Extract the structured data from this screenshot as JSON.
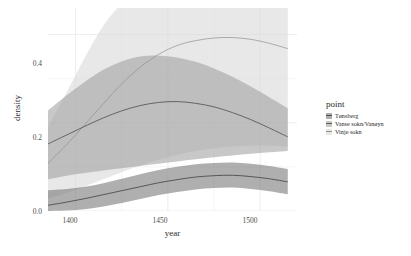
{
  "chart_data": {
    "type": "area",
    "title": "",
    "xlabel": "year",
    "ylabel": "density",
    "xlim": [
      1385,
      1520
    ],
    "ylim": [
      0.0,
      0.46
    ],
    "x_ticks": [
      1400,
      1450,
      1500
    ],
    "x_tick_labels": [
      "1400",
      "1450",
      "1500"
    ],
    "y_ticks": [
      0.0,
      0.2,
      0.4
    ],
    "y_tick_labels": [
      "0.0",
      "0.2",
      "0.4"
    ],
    "grid": true,
    "legend_position": "right",
    "legend_title": "point",
    "x": [
      1385,
      1395,
      1405,
      1415,
      1425,
      1435,
      1445,
      1455,
      1465,
      1475,
      1485,
      1495,
      1505,
      1515
    ],
    "series": [
      {
        "name": "Tønsberg",
        "color": "#4d4d4d",
        "band_color": "#6e6e6e",
        "band_opacity": 0.55,
        "values": [
          0.013,
          0.02,
          0.028,
          0.037,
          0.046,
          0.055,
          0.064,
          0.071,
          0.077,
          0.08,
          0.081,
          0.078,
          0.073,
          0.066
        ],
        "band_lower": [
          0.0,
          0.001,
          0.004,
          0.01,
          0.018,
          0.027,
          0.036,
          0.043,
          0.049,
          0.052,
          0.053,
          0.05,
          0.045,
          0.038
        ],
        "band_upper": [
          0.047,
          0.05,
          0.055,
          0.063,
          0.073,
          0.083,
          0.093,
          0.1,
          0.106,
          0.109,
          0.11,
          0.107,
          0.102,
          0.095
        ]
      },
      {
        "name": "Vanse sokn/Vanøyn",
        "color": "#5a5a5a",
        "band_color": "#9a9a9a",
        "band_opacity": 0.55,
        "values": [
          0.152,
          0.172,
          0.192,
          0.211,
          0.227,
          0.239,
          0.246,
          0.248,
          0.244,
          0.236,
          0.223,
          0.207,
          0.188,
          0.168
        ],
        "band_lower": [
          0.072,
          0.08,
          0.086,
          0.092,
          0.097,
          0.102,
          0.107,
          0.112,
          0.117,
          0.122,
          0.126,
          0.13,
          0.133,
          0.136
        ],
        "band_upper": [
          0.228,
          0.262,
          0.293,
          0.32,
          0.339,
          0.35,
          0.352,
          0.348,
          0.338,
          0.323,
          0.304,
          0.282,
          0.258,
          0.233
        ]
      },
      {
        "name": "Vinje sokn",
        "color": "#8f8f8f",
        "band_color": "#d8d8d8",
        "band_opacity": 0.6,
        "values": [
          0.108,
          0.15,
          0.196,
          0.243,
          0.288,
          0.326,
          0.355,
          0.375,
          0.386,
          0.392,
          0.393,
          0.389,
          0.38,
          0.368
        ],
        "band_lower": [
          0.028,
          0.041,
          0.056,
          0.072,
          0.088,
          0.103,
          0.116,
          0.127,
          0.136,
          0.142,
          0.146,
          0.148,
          0.148,
          0.146
        ],
        "band_upper": [
          0.19,
          0.268,
          0.348,
          0.42,
          0.47,
          0.5,
          0.516,
          0.524,
          0.528,
          0.53,
          0.53,
          0.528,
          0.524,
          0.518
        ]
      }
    ]
  },
  "axis": {
    "y_label": "density",
    "x_label": "year",
    "y_tick_0": "0.0",
    "y_tick_1": "0.2",
    "y_tick_2": "0.4",
    "x_tick_0": "1400",
    "x_tick_1": "1450",
    "x_tick_2": "1500"
  },
  "legend": {
    "title": "point",
    "items": [
      {
        "label": "Tønsberg"
      },
      {
        "label": "Vanse sokn/Vanøyn"
      },
      {
        "label": "Vinje sokn"
      }
    ]
  },
  "colors": {
    "panel_background": "#ffffff",
    "gridline": "#ebebeb",
    "text": "#4d4d4d",
    "series_1_band": "#6e6e6e",
    "series_2_band": "#9a9a9a",
    "series_3_band": "#d8d8d8"
  }
}
